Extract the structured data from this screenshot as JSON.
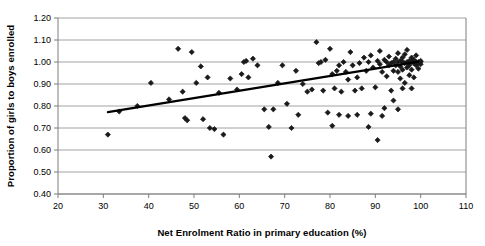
{
  "chart_data": {
    "type": "scatter",
    "title": "",
    "xlabel": "Net Enrolment Ratio in primary education (%)",
    "ylabel": "Proportion of girls to boys enrolled",
    "xlim": [
      20,
      110
    ],
    "ylim": [
      0.4,
      1.2
    ],
    "xticks": [
      "20",
      "30",
      "40",
      "50",
      "60",
      "70",
      "80",
      "90",
      "100",
      "110"
    ],
    "yticks": [
      "0.40",
      "0.50",
      "0.60",
      "0.70",
      "0.80",
      "0.90",
      "1.00",
      "1.10",
      "1.20"
    ],
    "xtick_values": [
      20,
      30,
      40,
      50,
      60,
      70,
      80,
      90,
      100,
      110
    ],
    "ytick_values": [
      0.4,
      0.5,
      0.6,
      0.7,
      0.8,
      0.9,
      1.0,
      1.1,
      1.2
    ],
    "grid": "horizontal",
    "legend": "none",
    "marker": "diamond",
    "marker_color": "#1a1a1a",
    "marker_size": 2.6,
    "grid_color": "#8c8c8c",
    "axis_color": "#7f7f7f",
    "trendline": {
      "type": "linear",
      "color": "#000000",
      "width": 2.2,
      "x_start": 31,
      "y_start": 0.772,
      "x_end": 99.5,
      "y_end": 1.002
    },
    "points": [
      [
        31.0,
        0.67
      ],
      [
        33.5,
        0.775
      ],
      [
        37.5,
        0.8
      ],
      [
        40.5,
        0.905
      ],
      [
        44.5,
        0.83
      ],
      [
        46.5,
        1.06
      ],
      [
        47.5,
        0.865
      ],
      [
        48.0,
        0.745
      ],
      [
        48.5,
        0.735
      ],
      [
        49.5,
        1.045
      ],
      [
        50.5,
        0.905
      ],
      [
        51.5,
        0.98
      ],
      [
        52.0,
        0.74
      ],
      [
        53.0,
        0.93
      ],
      [
        53.5,
        0.7
      ],
      [
        54.5,
        0.695
      ],
      [
        55.5,
        0.86
      ],
      [
        56.5,
        0.67
      ],
      [
        58.0,
        0.925
      ],
      [
        59.5,
        0.875
      ],
      [
        60.5,
        0.945
      ],
      [
        61.0,
        1.0
      ],
      [
        61.5,
        1.005
      ],
      [
        62.0,
        0.93
      ],
      [
        63.0,
        1.015
      ],
      [
        64.0,
        0.985
      ],
      [
        65.5,
        0.785
      ],
      [
        66.5,
        0.705
      ],
      [
        67.0,
        0.57
      ],
      [
        68.5,
        0.905
      ],
      [
        69.5,
        0.985
      ],
      [
        70.5,
        0.81
      ],
      [
        71.5,
        0.7
      ],
      [
        72.5,
        0.96
      ],
      [
        74.0,
        0.9
      ],
      [
        75.0,
        0.865
      ],
      [
        76.0,
        0.875
      ],
      [
        77.0,
        1.09
      ],
      [
        77.5,
        0.995
      ],
      [
        78.0,
        1.0
      ],
      [
        78.5,
        0.87
      ],
      [
        79.0,
        1.01
      ],
      [
        79.5,
        0.77
      ],
      [
        80.0,
        1.06
      ],
      [
        80.5,
        0.945
      ],
      [
        81.0,
        0.88
      ],
      [
        81.5,
        0.96
      ],
      [
        82.0,
        0.985
      ],
      [
        82.5,
        0.865
      ],
      [
        83.0,
        1.0
      ],
      [
        83.5,
        0.955
      ],
      [
        84.0,
        0.92
      ],
      [
        84.5,
        1.045
      ],
      [
        85.0,
        0.985
      ],
      [
        85.5,
        0.87
      ],
      [
        86.0,
        0.93
      ],
      [
        86.5,
        0.995
      ],
      [
        87.0,
        0.88
      ],
      [
        87.5,
        1.02
      ],
      [
        88.0,
        0.96
      ],
      [
        88.5,
        1.0
      ],
      [
        88.5,
        0.705
      ],
      [
        89.0,
        1.03
      ],
      [
        89.5,
        0.975
      ],
      [
        90.0,
        0.885
      ],
      [
        90.5,
        1.005
      ],
      [
        90.5,
        0.645
      ],
      [
        91.0,
        0.99
      ],
      [
        91.0,
        1.05
      ],
      [
        91.5,
        0.955
      ],
      [
        92.0,
        1.01
      ],
      [
        92.5,
        0.935
      ],
      [
        92.5,
        1.0
      ],
      [
        93.0,
        0.985
      ],
      [
        93.0,
        1.025
      ],
      [
        93.5,
        0.995
      ],
      [
        93.5,
        0.87
      ],
      [
        94.0,
        1.0
      ],
      [
        94.0,
        0.96
      ],
      [
        94.5,
        1.015
      ],
      [
        94.5,
        0.985
      ],
      [
        95.0,
        1.0
      ],
      [
        95.0,
        1.04
      ],
      [
        95.0,
        0.955
      ],
      [
        95.5,
        1.005
      ],
      [
        95.5,
        0.98
      ],
      [
        95.5,
        0.925
      ],
      [
        96.0,
        1.0
      ],
      [
        96.0,
        1.02
      ],
      [
        96.0,
        0.965
      ],
      [
        96.5,
        0.995
      ],
      [
        96.5,
        1.035
      ],
      [
        96.5,
        0.905
      ],
      [
        97.0,
        1.0
      ],
      [
        97.0,
        0.975
      ],
      [
        97.0,
        1.055
      ],
      [
        97.5,
        1.005
      ],
      [
        97.5,
        0.985
      ],
      [
        97.5,
        0.94
      ],
      [
        98.0,
        1.0
      ],
      [
        98.0,
        1.02
      ],
      [
        98.0,
        0.965
      ],
      [
        98.5,
        0.995
      ],
      [
        98.5,
        1.01
      ],
      [
        98.5,
        0.93
      ],
      [
        99.0,
        1.0
      ],
      [
        99.0,
        0.985
      ],
      [
        99.0,
        1.03
      ],
      [
        99.5,
        1.0
      ],
      [
        99.5,
        0.995
      ],
      [
        99.5,
        0.97
      ],
      [
        100.0,
        1.0
      ],
      [
        100.0,
        1.005
      ],
      [
        100.0,
        0.99
      ],
      [
        86.0,
        0.76
      ],
      [
        89.0,
        0.765
      ],
      [
        91.5,
        0.755
      ],
      [
        84.0,
        0.755
      ],
      [
        82.0,
        0.76
      ],
      [
        94.0,
        0.825
      ],
      [
        96.0,
        0.88
      ],
      [
        98.0,
        0.88
      ],
      [
        92.0,
        0.79
      ],
      [
        95.0,
        0.785
      ],
      [
        73.0,
        0.76
      ],
      [
        80.5,
        0.71
      ],
      [
        67.5,
        0.785
      ]
    ]
  }
}
